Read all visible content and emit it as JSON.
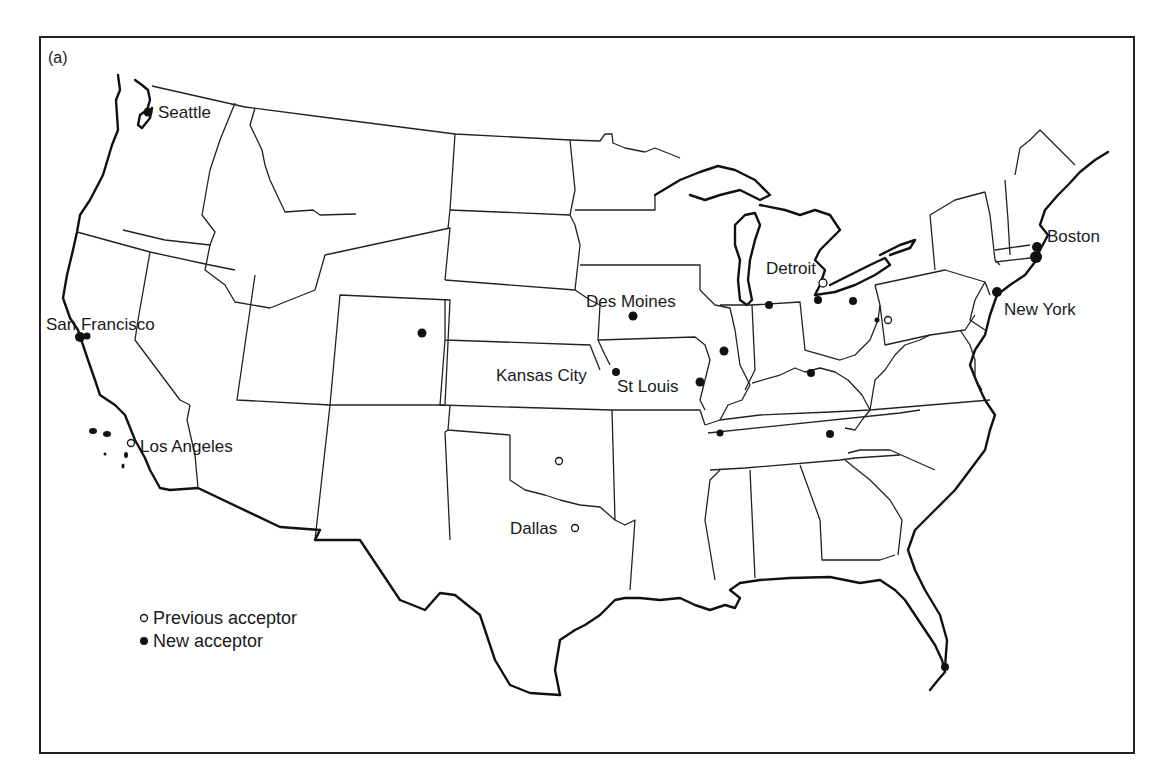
{
  "figure": {
    "panel_label": "(a)",
    "caption": ""
  },
  "legend": {
    "items": [
      {
        "symbol": "open-circle",
        "label": "Previous acceptor"
      },
      {
        "symbol": "filled-circle",
        "label": "New acceptor"
      }
    ]
  },
  "cities": [
    {
      "name": "Seattle",
      "type": "new",
      "x": 148,
      "y": 112,
      "label_x": 160,
      "label_y": 118
    },
    {
      "name": "San Francisco",
      "type": "new",
      "x": 80,
      "y": 337,
      "label_x": 46,
      "label_y": 330
    },
    {
      "name": "Los Angeles",
      "type": "previous",
      "x": 130,
      "y": 443,
      "label_x": 140,
      "label_y": 452
    },
    {
      "name": "Des Moines",
      "type": "new",
      "x": 633,
      "y": 316,
      "label_x": 586,
      "label_y": 308
    },
    {
      "name": "Kansas City",
      "type": "new",
      "x": 616,
      "y": 372,
      "label_x": 496,
      "label_y": 378
    },
    {
      "name": "St Louis",
      "type": "new",
      "x": 700,
      "y": 382,
      "label_x": 617,
      "label_y": 392
    },
    {
      "name": "Detroit",
      "type": "previous",
      "x": 822,
      "y": 283,
      "label_x": 767,
      "label_y": 274
    },
    {
      "name": "Boston",
      "type": "new",
      "x": 1037,
      "y": 246,
      "label_x": 1047,
      "label_y": 242
    },
    {
      "name": "New York",
      "type": "new",
      "x": 997,
      "y": 293,
      "label_x": 1005,
      "label_y": 315
    },
    {
      "name": "Dallas",
      "type": "previous",
      "x": 575,
      "y": 528,
      "label_x": 510,
      "label_y": 534
    }
  ],
  "unlabeled_markers": [
    {
      "type": "new",
      "x": 422,
      "y": 333
    },
    {
      "name_hint": "Illinois",
      "type": "new",
      "x": 724,
      "y": 351
    },
    {
      "name_hint": "Chicago-area",
      "type": "new",
      "x": 769,
      "y": 305
    },
    {
      "name_hint": "Toledo",
      "type": "new",
      "x": 818,
      "y": 300
    },
    {
      "name_hint": "Cleveland",
      "type": "new",
      "x": 853,
      "y": 301
    },
    {
      "name_hint": "Columbus",
      "type": "new",
      "x": 811,
      "y": 373
    },
    {
      "name_hint": "Pittsburgh",
      "type": "previous",
      "x": 888,
      "y": 320
    },
    {
      "name_hint": "Memphis",
      "type": "new",
      "x": 720,
      "y": 433
    },
    {
      "name_hint": "Knoxville",
      "type": "new",
      "x": 830,
      "y": 434
    },
    {
      "name_hint": "Oklahoma",
      "type": "previous",
      "x": 559,
      "y": 461
    },
    {
      "name_hint": "Miami",
      "type": "new",
      "x": 945,
      "y": 667
    }
  ],
  "colors": {
    "ink": "#111111",
    "background": "#ffffff"
  }
}
